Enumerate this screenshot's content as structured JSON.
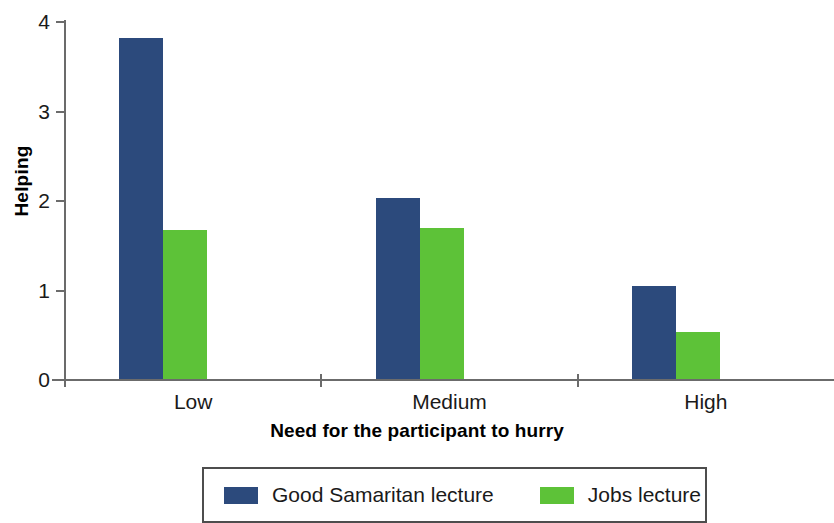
{
  "chart_data": {
    "type": "bar",
    "title": "",
    "subtitle": "",
    "xlabel": "Need for the participant to hurry",
    "ylabel": "Helping",
    "categories": [
      "Low",
      "Medium",
      "High"
    ],
    "series": [
      {
        "name": "Good Samaritan lecture",
        "color": "#2c4a7c",
        "values": [
          3.82,
          2.03,
          1.05
        ]
      },
      {
        "name": "Jobs lecture",
        "color": "#5dc238",
        "values": [
          1.68,
          1.7,
          0.54
        ]
      }
    ],
    "ylim": [
      0,
      4
    ],
    "yticks": [
      0,
      1,
      2,
      3,
      4
    ],
    "ytick_labels": [
      "0",
      "1",
      "2",
      "3",
      "4"
    ],
    "grid": false,
    "legend_position": "bottom",
    "axis_color": "#6b6b6b"
  },
  "legend": {
    "entries": [
      {
        "label": "Good Samaritan lecture",
        "color": "#2c4a7c"
      },
      {
        "label": "Jobs lecture",
        "color": "#5dc238"
      }
    ]
  }
}
